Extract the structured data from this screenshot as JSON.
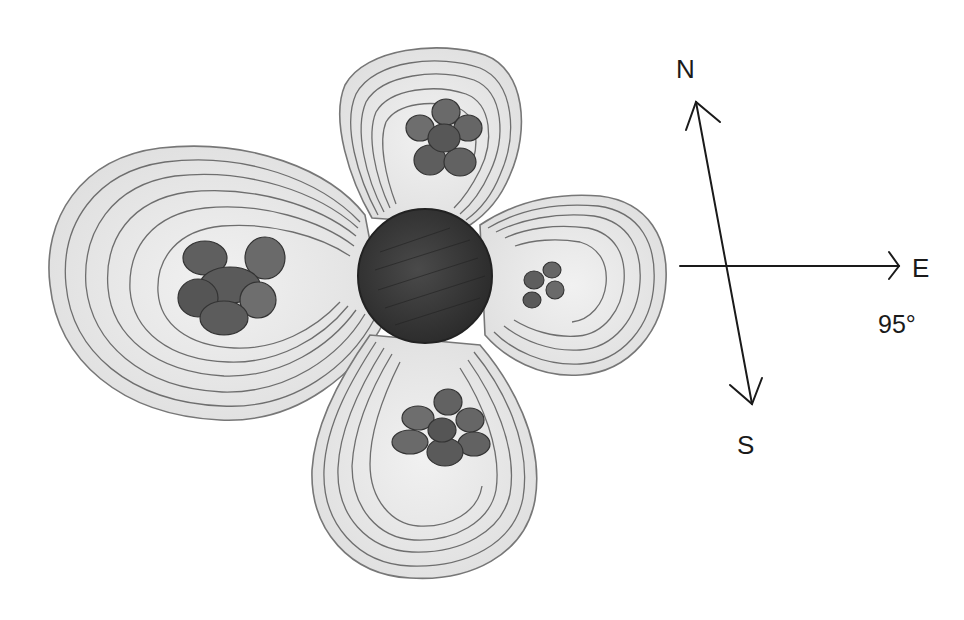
{
  "diagram": {
    "colors": {
      "background": "#ffffff",
      "lobe_fill": "#e6e6e6",
      "lobe_inner": "#efefef",
      "contour_line": "#6e6e6e",
      "core_fill": "#3a3a3a",
      "cluster_fill": "#6a6a6a",
      "ink": "#1a1a1a"
    },
    "core": {
      "name": "central-sphere",
      "cx": 425,
      "cy": 276,
      "r": 67
    },
    "lobes": [
      {
        "name": "west-lobe",
        "size": "large",
        "cluster": "west-cluster"
      },
      {
        "name": "north-lobe",
        "size": "medium",
        "cluster": "north-cluster"
      },
      {
        "name": "east-lobe",
        "size": "small",
        "cluster": "east-cluster"
      },
      {
        "name": "south-lobe",
        "size": "medium",
        "cluster": "south-cluster"
      }
    ]
  },
  "compass": {
    "north_label": "N",
    "east_label": "E",
    "south_label": "S",
    "angle_label": "95°"
  }
}
